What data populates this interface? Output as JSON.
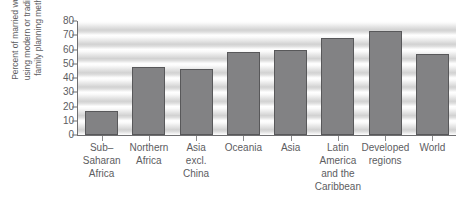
{
  "chart_data": {
    "type": "bar",
    "title": "",
    "xlabel": "",
    "ylabel": "Percent of married women using modern or traditional family planning methods",
    "ylabel_lines": [
      "Percent of married women",
      "using modern or traditional",
      "family planning methods"
    ],
    "ylim": [
      0,
      80
    ],
    "yticks": [
      0,
      10,
      20,
      30,
      40,
      50,
      60,
      70,
      80
    ],
    "ytick_labels": [
      "0",
      "10",
      "20",
      "30",
      "40",
      "50",
      "60",
      "70",
      "80"
    ],
    "grid": false,
    "legend": "none",
    "categories": [
      "Sub-\nSaharan\nAfrica",
      "Northern\nAfrica",
      "Asia\nexcl.\nChina",
      "Oceania",
      "Asia",
      "Latin\nAmerica\nand the\nCaribbean",
      "Developed\nregions",
      "World"
    ],
    "category_lines": [
      [
        "Sub–",
        "Saharan",
        "Africa"
      ],
      [
        "Northern",
        "Africa"
      ],
      [
        "Asia",
        "excl.",
        "China"
      ],
      [
        "Oceania"
      ],
      [
        "Asia"
      ],
      [
        "Latin",
        "America",
        "and the",
        "Caribbean"
      ],
      [
        "Developed",
        "regions"
      ],
      [
        "World"
      ]
    ],
    "values": [
      17,
      48,
      46,
      58,
      60,
      68,
      73,
      57
    ],
    "colors": {
      "bar_fill": "#828284",
      "bar_edge": "#58585a",
      "axis": "#6f6f71",
      "text": "#5d5d5f",
      "background": "#ffffff",
      "stripe_light": "#ffffff",
      "stripe_dark": "#d2d2d2"
    }
  }
}
